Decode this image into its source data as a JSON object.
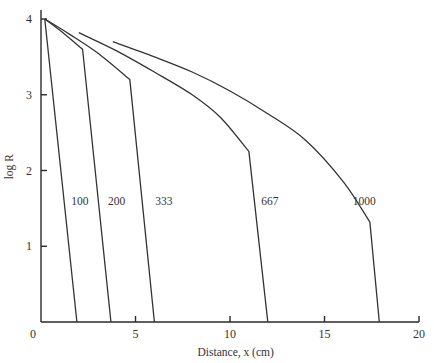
{
  "chart_data": {
    "type": "line",
    "title": "",
    "xlabel": "Distance, x (cm)",
    "ylabel": "log R",
    "xlim": [
      0,
      20
    ],
    "ylim": [
      0,
      4
    ],
    "xticks": [
      0,
      5,
      10,
      15,
      20
    ],
    "yticks": [
      1,
      2,
      3,
      4
    ],
    "grid": false,
    "legend": "none (inline curve labels)",
    "series": [
      {
        "name": "100",
        "label_at": [
          1.6,
          1.6
        ],
        "points": [
          [
            0.2,
            4.0
          ],
          [
            1.9,
            0.0
          ]
        ]
      },
      {
        "name": "200",
        "label_at": [
          3.55,
          1.6
        ],
        "points": [
          [
            0.2,
            4.0
          ],
          [
            1.0,
            3.85
          ],
          [
            2.2,
            3.6
          ],
          [
            3.7,
            0.0
          ]
        ]
      },
      {
        "name": "333",
        "label_at": [
          6.05,
          1.6
        ],
        "points": [
          [
            0.2,
            4.0
          ],
          [
            1.5,
            3.8
          ],
          [
            3.0,
            3.55
          ],
          [
            4.7,
            3.2
          ],
          [
            6.0,
            0.0
          ]
        ]
      },
      {
        "name": "667",
        "label_at": [
          11.65,
          1.6
        ],
        "points": [
          [
            2.0,
            3.82
          ],
          [
            4.0,
            3.58
          ],
          [
            6.0,
            3.3
          ],
          [
            8.0,
            3.0
          ],
          [
            9.5,
            2.7
          ],
          [
            11.0,
            2.25
          ],
          [
            12.0,
            0.0
          ]
        ]
      },
      {
        "name": "1000",
        "label_at": [
          16.5,
          1.6
        ],
        "points": [
          [
            3.8,
            3.7
          ],
          [
            6.0,
            3.5
          ],
          [
            8.0,
            3.3
          ],
          [
            10.0,
            3.05
          ],
          [
            12.0,
            2.75
          ],
          [
            14.0,
            2.4
          ],
          [
            16.0,
            1.85
          ],
          [
            17.4,
            1.32
          ],
          [
            17.9,
            0.0
          ]
        ]
      }
    ]
  }
}
